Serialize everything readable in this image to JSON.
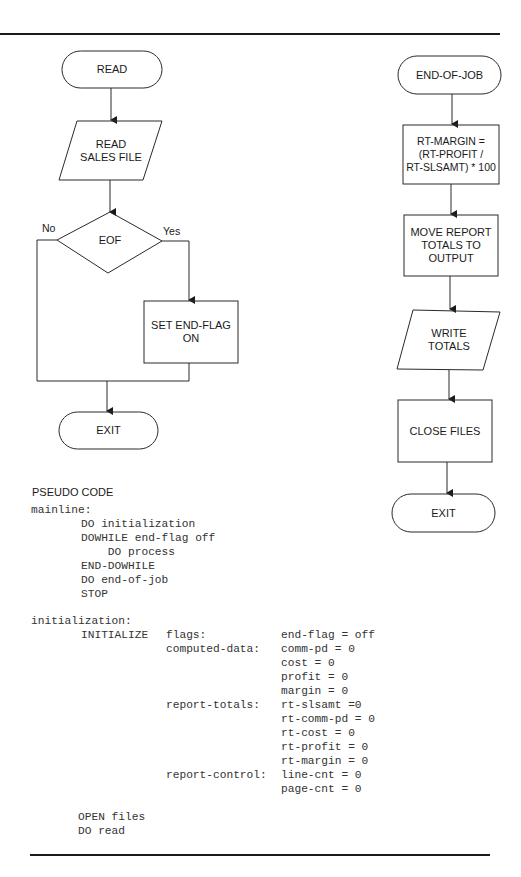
{
  "flowchart_read": {
    "start": "READ",
    "io_read": "READ\nSALES FILE",
    "decision": "EOF",
    "no_label": "No",
    "yes_label": "Yes",
    "process_set_flag": "SET END-FLAG\nON",
    "end": "EXIT"
  },
  "flowchart_end_of_job": {
    "start": "END-OF-JOB",
    "process_margin": "RT-MARGIN =\n(RT-PROFIT /\nRT-SLSAMT) * 100",
    "process_move": "MOVE REPORT\nTOTALS TO\nOUTPUT",
    "io_write": "WRITE\nTOTALS",
    "process_close": "CLOSE FILES",
    "end": "EXIT"
  },
  "pseudo_code": {
    "heading": "PSEUDO CODE",
    "mainline": {
      "label": "mainline:",
      "lines": [
        "DO initialization",
        "DOWHILE end-flag off",
        "    DO process",
        "END-DOWHILE",
        "DO end-of-job",
        "STOP"
      ]
    },
    "initialization": {
      "label": "initialization:",
      "keyword": "INITIALIZE",
      "groups": [
        {
          "name": "flags:",
          "items": [
            "end-flag = off"
          ]
        },
        {
          "name": "computed-data:",
          "items": [
            "comm-pd = 0",
            "cost = 0",
            "profit = 0",
            "margin = 0"
          ]
        },
        {
          "name": "report-totals:",
          "items": [
            "rt-slsamt =0",
            "rt-comm-pd = 0",
            "rt-cost = 0",
            "rt-profit = 0",
            "rt-margin = 0"
          ]
        },
        {
          "name": "report-control:",
          "items": [
            "line-cnt = 0",
            "page-cnt = 0"
          ]
        }
      ],
      "trailing": [
        "OPEN files",
        "DO read"
      ]
    }
  }
}
